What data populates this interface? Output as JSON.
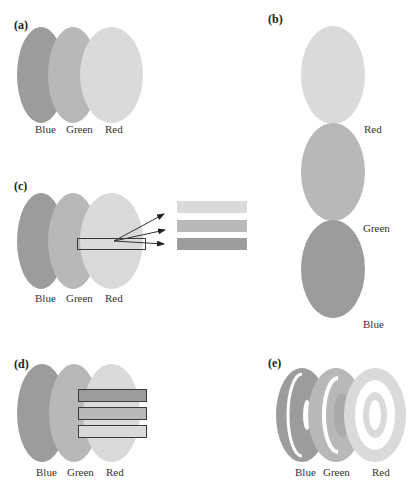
{
  "panels": {
    "a": {
      "label": "(a)",
      "ellipses": [
        "Blue",
        "Green",
        "Red"
      ]
    },
    "b": {
      "label": "(b)",
      "ellipses": [
        "Red",
        "Green",
        "Blue"
      ]
    },
    "c": {
      "label": "(c)",
      "ellipses": [
        "Blue",
        "Green",
        "Red"
      ],
      "bars": [
        "Red",
        "Green",
        "Blue"
      ]
    },
    "d": {
      "label": "(d)",
      "ellipses": [
        "Blue",
        "Green",
        "Red"
      ],
      "bars": [
        "Blue",
        "Green",
        "Red"
      ]
    },
    "e": {
      "label": "(e)",
      "rings": [
        "Blue",
        "Green",
        "Red"
      ]
    }
  },
  "colors": {
    "blue": "#9c9c9c",
    "green": "#b8b8b8",
    "red": "#dadada",
    "outline": "#3a3a3a"
  }
}
